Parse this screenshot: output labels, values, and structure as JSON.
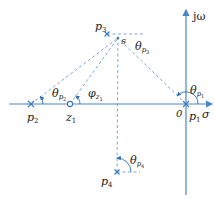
{
  "diagram": {
    "type": "pole-zero angle diagram (s-plane)",
    "axes": {
      "real_label": "σ",
      "imag_label": "jω",
      "origin_label": "0"
    },
    "points": {
      "p1": {
        "label": "p",
        "sub": "1"
      },
      "p2": {
        "label": "p",
        "sub": "2"
      },
      "p3": {
        "label": "p",
        "sub": "3"
      },
      "p4": {
        "label": "p",
        "sub": "4"
      },
      "z1": {
        "label": "z",
        "sub": "1"
      },
      "s": {
        "label": "s"
      }
    },
    "angles": {
      "theta_p1": {
        "label": "θ",
        "sub": "p",
        "subsub": "1"
      },
      "theta_p2": {
        "label": "θ",
        "sub": "p",
        "subsub": "2"
      },
      "theta_p3": {
        "label": "θ",
        "sub": "p",
        "subsub": "3"
      },
      "theta_p4": {
        "label": "θ",
        "sub": "p",
        "subsub": "4"
      },
      "phi_z1": {
        "label": "φ",
        "sub": "z",
        "subsub": "1"
      }
    },
    "colors": {
      "axis": "#4a86c5",
      "dashed": "#6f9fd0",
      "text": "#222222"
    }
  }
}
